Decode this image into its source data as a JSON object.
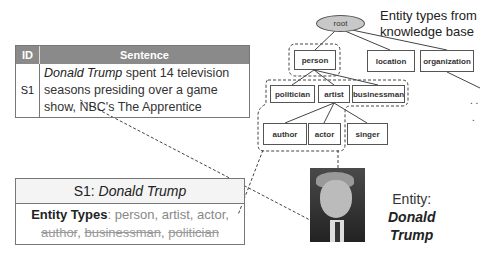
{
  "sentence_table": {
    "headers": {
      "id": "ID",
      "sentence": "Sentence"
    },
    "rows": [
      {
        "id": "S1",
        "mention": "Donald Trump",
        "rest": " spent 14 television seasons presiding over a game show, NBC's The Apprentice"
      }
    ]
  },
  "knowledge_base": {
    "title_line1": "Entity types from",
    "title_line2": "knowledge base",
    "root": "root",
    "nodes": {
      "person": "person",
      "location": "location",
      "organization": "organization",
      "politician": "politician",
      "artist": "artist",
      "businessman": "businessman",
      "author": "author",
      "actor": "actor",
      "singer": "singer"
    },
    "ellipsis": ". ."
  },
  "result_box": {
    "header_prefix": "S1: ",
    "header_entity": "Donald Trump",
    "types_label": "Entity Types",
    "kept_types": ": person, artist, actor,",
    "removed_types": [
      "author",
      "businessman",
      "politician"
    ]
  },
  "entity": {
    "label": "Entity:",
    "name_line1": "Donald",
    "name_line2": "Trump"
  }
}
